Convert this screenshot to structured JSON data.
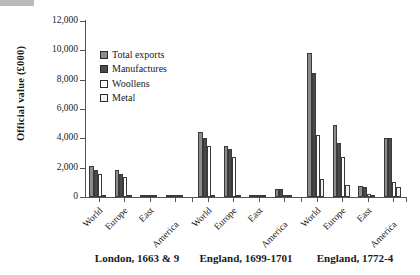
{
  "chart_data": {
    "type": "bar",
    "title": "",
    "subtitle": "",
    "xlabel": "",
    "ylabel": "Official value (£000)",
    "ylim": [
      0,
      12000
    ],
    "ytick_step": 2000,
    "ytick_labels": [
      "12,000",
      "10,000",
      "8,000",
      "6,000",
      "4,000",
      "2,000",
      "0"
    ],
    "ytick_values": [
      12000,
      10000,
      8000,
      6000,
      4000,
      2000,
      0
    ],
    "grid": false,
    "legend_position": "upper-left-inside",
    "series": [
      {
        "name": "Total exports",
        "color": "#8c8c8c",
        "values": [
          2100,
          1850,
          60,
          120,
          4400,
          3500,
          110,
          580,
          9800,
          4900,
          780,
          4050
        ]
      },
      {
        "name": "Manufactures",
        "color": "#4a4a4a",
        "values": [
          1830,
          1600,
          50,
          110,
          4050,
          3250,
          95,
          530,
          8450,
          3700,
          680,
          4000
        ]
      },
      {
        "name": "Woollens",
        "color": "#ffffff",
        "values": [
          1570,
          1380,
          30,
          40,
          3500,
          2750,
          40,
          120,
          4250,
          2700,
          200,
          1000
        ]
      },
      {
        "name": "Metal",
        "color": "#f2f2f2",
        "values": [
          40,
          30,
          5,
          20,
          120,
          130,
          10,
          80,
          1250,
          800,
          110,
          650
        ]
      }
    ],
    "groups": [
      {
        "caption": "London, 1663 & 9",
        "categories": [
          "World",
          "Europe",
          "East",
          "America"
        ]
      },
      {
        "caption": "England, 1699-1701",
        "categories": [
          "World",
          "Europe",
          "East",
          "America"
        ]
      },
      {
        "caption": "England, 1772-4",
        "categories": [
          "World",
          "Europe",
          "East",
          "America"
        ]
      }
    ],
    "categories": [
      "World",
      "Europe",
      "East",
      "America",
      "World",
      "Europe",
      "East",
      "America",
      "World",
      "Europe",
      "East",
      "America"
    ]
  },
  "legend": {
    "items": [
      {
        "label": "Total exports",
        "color": "#8c8c8c"
      },
      {
        "label": "Manufactures",
        "color": "#4a4a4a"
      },
      {
        "label": "Woollens",
        "color": "#ffffff"
      },
      {
        "label": "Metal",
        "color": "#f2f2f2"
      }
    ]
  },
  "axis": {
    "y_title": "Official value (£000)"
  }
}
